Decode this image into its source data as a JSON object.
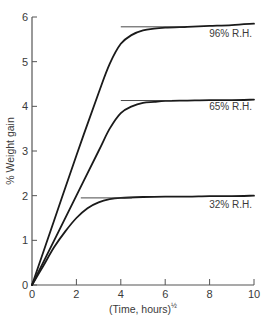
{
  "chart_data": {
    "type": "line",
    "title": "",
    "xlabel": "(Time, hours)",
    "xlabel_superscript": "½",
    "ylabel": "% Weight gain",
    "xlim": [
      0,
      10
    ],
    "ylim": [
      0,
      6
    ],
    "xticks": [
      0,
      2,
      4,
      6,
      8,
      10
    ],
    "yticks": [
      0,
      1,
      2,
      3,
      4,
      5,
      6
    ],
    "grid": false,
    "legend": "none (curves labeled inline)",
    "series": [
      {
        "name": "96% R.H.",
        "x": [
          0,
          1,
          2,
          3,
          3.5,
          4,
          4.5,
          5,
          5.5,
          6,
          7,
          8,
          9,
          10
        ],
        "values": [
          0,
          1.45,
          2.9,
          4.3,
          4.95,
          5.4,
          5.6,
          5.7,
          5.74,
          5.76,
          5.78,
          5.8,
          5.82,
          5.85
        ],
        "tangent": {
          "y": 5.78,
          "x_start": 4.0,
          "x_end": 6.9
        }
      },
      {
        "name": "65% R.H.",
        "x": [
          0,
          1,
          2,
          3,
          3.5,
          4,
          4.5,
          5,
          5.5,
          6,
          7,
          8,
          9,
          10
        ],
        "values": [
          0,
          1.0,
          2.0,
          3.0,
          3.5,
          3.85,
          4.0,
          4.08,
          4.1,
          4.12,
          4.13,
          4.14,
          4.14,
          4.15
        ],
        "tangent": {
          "y": 4.13,
          "x_start": 4.0,
          "x_end": 6.3
        }
      },
      {
        "name": "32% R.H.",
        "x": [
          0,
          0.5,
          1,
          1.5,
          2,
          2.5,
          3,
          3.5,
          4,
          5,
          6,
          7,
          8,
          9,
          10
        ],
        "values": [
          0,
          0.42,
          0.85,
          1.2,
          1.5,
          1.72,
          1.85,
          1.92,
          1.95,
          1.97,
          1.98,
          1.98,
          1.99,
          1.99,
          2.0
        ],
        "tangent": {
          "y": 1.95,
          "x_start": 2.2,
          "x_end": 4.5
        }
      }
    ]
  },
  "colors": {
    "line": "#1a1a1a",
    "axis": "#555555",
    "tangent": "#333333",
    "text": "#3a3a3a"
  }
}
